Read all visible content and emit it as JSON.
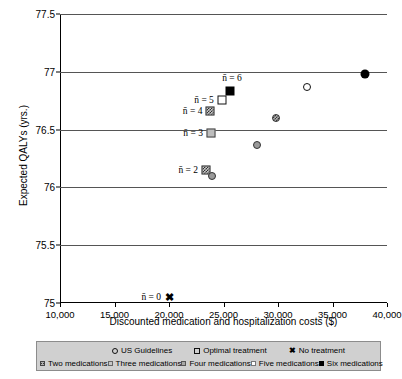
{
  "chart_data": {
    "type": "scatter",
    "title": "",
    "xlabel": "Discounted medication and hospitalization costs ($)",
    "ylabel": "Expected QALYs (yrs.)",
    "xlim": [
      10000,
      40000
    ],
    "ylim": [
      75,
      77.5
    ],
    "xticks": [
      "10,000",
      "15,000",
      "20,000",
      "25,000",
      "30,000",
      "35,000",
      "40,000"
    ],
    "xtick_values": [
      10000,
      15000,
      20000,
      25000,
      30000,
      35000,
      40000
    ],
    "yticks": [
      "75",
      "75.5",
      "76",
      "76.5",
      "77",
      "77.5"
    ],
    "ytick_values": [
      75,
      75.5,
      76,
      76.5,
      77,
      77.5
    ],
    "grid": "horizontal",
    "legend_position": "below-axis",
    "points": [
      {
        "label": "n-bar = 0",
        "annotation": "n̄ = 0",
        "series": "No treatment",
        "marker": "cross",
        "x": 20000,
        "y": 75.05,
        "annot_dx": -8
      },
      {
        "label": "n-bar = 2",
        "annotation": "n̄ = 2",
        "series": "Two medications",
        "marker": "square-hatch",
        "x": 23400,
        "y": 76.15,
        "annot_dx": -8
      },
      {
        "label": "n-bar = 3",
        "annotation": "n̄ = 3",
        "series": "Three medications",
        "marker": "square-gray",
        "x": 23850,
        "y": 76.47,
        "annot_dx": -8
      },
      {
        "label": "n-bar = 4",
        "annotation": "n̄ = 4",
        "series": "Four medications",
        "marker": "square-hatch",
        "x": 23800,
        "y": 76.66,
        "annot_dx": -8
      },
      {
        "label": "n-bar = 5",
        "annotation": "n̄ = 5",
        "series": "Five medications",
        "marker": "square-open",
        "x": 24850,
        "y": 76.76,
        "annot_dx": -8
      },
      {
        "label": "n-bar = 6",
        "annotation": "n̄ = 6",
        "series": "Six medications",
        "marker": "square-filled",
        "x": 25600,
        "y": 76.83,
        "annot_dx": 0,
        "annot_above": true
      },
      {
        "label": "guideline-low",
        "annotation": "",
        "series": "US Guidelines",
        "marker": "circle-gray",
        "x": 23900,
        "y": 76.1
      },
      {
        "label": "guideline-mid",
        "annotation": "",
        "series": "US Guidelines",
        "marker": "circle-gray",
        "x": 28100,
        "y": 76.37
      },
      {
        "label": "guideline-hatch",
        "annotation": "",
        "series": "US Guidelines",
        "marker": "circle-hatch",
        "x": 29800,
        "y": 76.6
      },
      {
        "label": "guideline-open",
        "annotation": "",
        "series": "US Guidelines",
        "marker": "circle-open",
        "x": 32700,
        "y": 76.87
      },
      {
        "label": "optimal-top",
        "annotation": "",
        "series": "Six medications",
        "marker": "circle-filled",
        "x": 38000,
        "y": 76.98
      }
    ],
    "legend": {
      "row1": [
        {
          "text": "US Guidelines",
          "marker": "circle-open"
        },
        {
          "text": "Optimal treatment",
          "marker": "square-open"
        },
        {
          "text": "No treatment",
          "marker": "cross"
        }
      ],
      "row2": [
        {
          "text": "Two medications",
          "marker": "square-hatch"
        },
        {
          "text": "Three medications",
          "marker": "square-lightgray"
        },
        {
          "text": "Four medications",
          "marker": "square-midgray"
        },
        {
          "text": "Five medications",
          "marker": "square-white"
        },
        {
          "text": "Six medications",
          "marker": "square-black"
        }
      ]
    }
  }
}
